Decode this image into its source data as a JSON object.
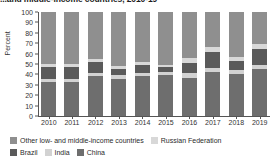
{
  "title": "...and middle-income countries, 2010-19",
  "chart_data": {
    "type": "bar",
    "title": "...and middle-income countries, 2010-19",
    "xlabel": "",
    "ylabel": "Percent",
    "ylim": [
      0,
      100
    ],
    "yticks": [
      0,
      10,
      20,
      30,
      40,
      50,
      60,
      70,
      80,
      90,
      100
    ],
    "grid": false,
    "stacked": true,
    "legend_position": "bottom",
    "categories": [
      "2010",
      "2011",
      "2012",
      "2013",
      "2014",
      "2015",
      "2016",
      "2017",
      "2018",
      "2019"
    ],
    "series": [
      {
        "name": "China",
        "color": "#6e6e6e",
        "values": [
          33,
          33,
          38,
          36,
          38,
          39,
          37,
          42,
          40,
          45
        ]
      },
      {
        "name": "India",
        "color": "#d2d2d2",
        "values": [
          3,
          3,
          3,
          3,
          3,
          3,
          4,
          4,
          4,
          4
        ]
      },
      {
        "name": "Brazil",
        "color": "#5a5a5a",
        "values": [
          11,
          11,
          11,
          6,
          8,
          5,
          10,
          16,
          9,
          15
        ]
      },
      {
        "name": "Russian Federation",
        "color": "#d8d8d8",
        "values": [
          3,
          3,
          3,
          3,
          3,
          2,
          5,
          4,
          4,
          5
        ]
      },
      {
        "name": "Other low- and middle-income countries",
        "color": "#8f8f8f",
        "values": [
          50,
          50,
          45,
          52,
          48,
          51,
          44,
          34,
          43,
          31
        ]
      }
    ]
  },
  "legend": {
    "row1": [
      {
        "label": "Other low- and middle-income countries",
        "color": "#8f8f8f"
      },
      {
        "label": "Russian Federation",
        "color": "#d8d8d8"
      }
    ],
    "row2": [
      {
        "label": "Brazil",
        "color": "#5a5a5a"
      },
      {
        "label": "India",
        "color": "#d2d2d2"
      },
      {
        "label": "China",
        "color": "#6e6e6e"
      }
    ]
  }
}
